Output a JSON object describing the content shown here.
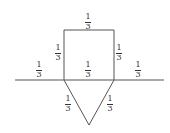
{
  "diagram": {
    "line_color": "#555555",
    "labels": [
      {
        "id": "top",
        "num": "1",
        "den": "3"
      },
      {
        "id": "square-left",
        "num": "1",
        "den": "3"
      },
      {
        "id": "square-right",
        "num": "1",
        "den": "3"
      },
      {
        "id": "line-left",
        "num": "1",
        "den": "3"
      },
      {
        "id": "line-middle",
        "num": "1",
        "den": "3"
      },
      {
        "id": "line-right",
        "num": "1",
        "den": "3"
      },
      {
        "id": "triangle-left",
        "num": "1",
        "den": "3"
      },
      {
        "id": "triangle-right",
        "num": "1",
        "den": "3"
      }
    ]
  }
}
